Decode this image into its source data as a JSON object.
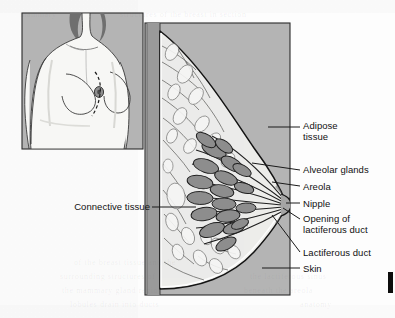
{
  "figure": {
    "colors": {
      "page_background": "#fdfdfd",
      "panel_background": "#b4b4b4",
      "panel_border": "#2b2b2b",
      "chest_wall": "#9a9a9a",
      "skin_outline": "#141414",
      "adipose_tissue": "#ededea",
      "alveolar_gland": "#8d8d8d",
      "connective_strand": "#4a4a4a",
      "label_text": "#111111",
      "leader_line": "#1a1a1a",
      "inset_body": "#f7f7f5",
      "inset_hair": "#6f6f6f"
    },
    "inset": {
      "name": "torso-orientation-inset",
      "description": "Anterior view of a female torso showing the plane of section through the left breast",
      "markings": {
        "section_plane": "dashed-curve",
        "areola_spot": "dark-circle"
      }
    },
    "main_panel": {
      "name": "breast-sagittal-section",
      "description": "Side (sagittal) cut-away of the breast showing fat, glands and ducts converging on the nipple"
    },
    "labels": [
      {
        "id": "adipose-tissue",
        "text": "Adipose\ntissue",
        "side": "right",
        "x": 303,
        "y": 121,
        "leader": {
          "x1": 268,
          "y1": 127,
          "x2": 300,
          "y2": 127
        }
      },
      {
        "id": "alveolar-glands",
        "text": "Alveolar glands",
        "side": "right",
        "x": 303,
        "y": 165,
        "leader": {
          "x1": 252,
          "y1": 163,
          "x2": 300,
          "y2": 170
        }
      },
      {
        "id": "areola",
        "text": "Areola",
        "side": "right",
        "x": 303,
        "y": 182,
        "leader": {
          "x1": 272,
          "y1": 182,
          "x2": 300,
          "y2": 186
        }
      },
      {
        "id": "nipple",
        "text": "Nipple",
        "side": "right",
        "x": 303,
        "y": 199,
        "leader": {
          "x1": 286,
          "y1": 203,
          "x2": 300,
          "y2": 203
        }
      },
      {
        "id": "opening-of-lactiferous-duct",
        "text": "Opening of\nlactiferous duct",
        "side": "right",
        "x": 303,
        "y": 214,
        "leader": {
          "x1": 283,
          "y1": 208,
          "x2": 300,
          "y2": 219
        }
      },
      {
        "id": "lactiferous-duct",
        "text": "Lactiferous duct",
        "side": "right",
        "x": 303,
        "y": 248,
        "leader": {
          "x1": 272,
          "y1": 215,
          "x2": 300,
          "y2": 252
        }
      },
      {
        "id": "skin",
        "text": "Skin",
        "side": "right",
        "x": 303,
        "y": 264,
        "leader": {
          "x1": 262,
          "y1": 268,
          "x2": 300,
          "y2": 268
        }
      },
      {
        "id": "connective-tissue",
        "text": "Connective tissue",
        "side": "left",
        "x": 62,
        "y": 202,
        "leader": {
          "x1": 152,
          "y1": 207,
          "x2": 196,
          "y2": 207
        }
      }
    ],
    "ghost_text": [
      {
        "t": "of the breast tissue and the",
        "x": 74,
        "y": 258
      },
      {
        "t": "surrounding structures of",
        "x": 60,
        "y": 272
      },
      {
        "t": "the mammary gland region",
        "x": 62,
        "y": 286
      },
      {
        "t": "lobules drain into ducts",
        "x": 70,
        "y": 300
      },
      {
        "t": "the lactiferous sinus",
        "x": 250,
        "y": 272
      },
      {
        "t": "beneath the areola",
        "x": 244,
        "y": 286
      },
      {
        "t": "anatomy",
        "x": 300,
        "y": 300
      },
      {
        "t": "mammary",
        "x": 20,
        "y": 10
      },
      {
        "t": "structures of the breast in section",
        "x": 120,
        "y": 10
      }
    ]
  }
}
